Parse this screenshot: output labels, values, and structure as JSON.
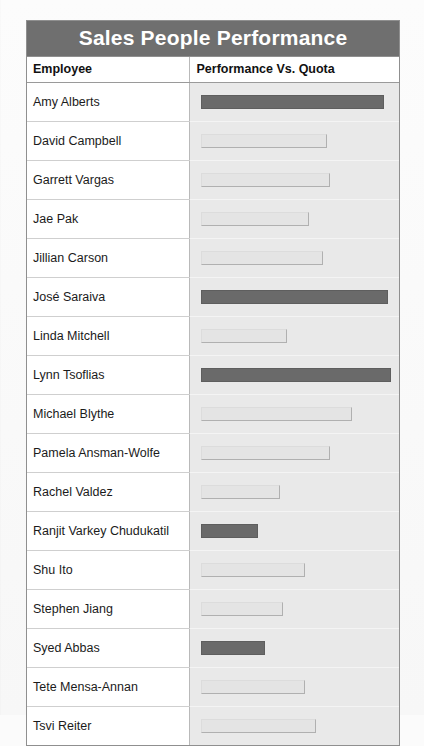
{
  "report": {
    "title": "Sales People Performance",
    "columns": [
      "Employee",
      "Performance Vs. Quota"
    ]
  },
  "colors": {
    "title_bar": "#6f6f6f",
    "title_text": "#ffffff",
    "bar_high": "#6a6a6a",
    "bar_low": "#e4e4e4",
    "bar_low_outline": "#b0b0b0",
    "plot_background": "#e9e9e9",
    "grid_border": "#8f8f8f"
  },
  "chart_data": {
    "type": "bar",
    "orientation": "horizontal",
    "title": "Sales People Performance",
    "xlabel": "Performance Vs. Quota",
    "ylabel": "Employee",
    "grid": false,
    "legend": "none",
    "value_unit": "relative bar length (0-100)",
    "xlim": [
      0,
      100
    ],
    "categories": [
      "Amy Alberts",
      "David Campbell",
      "Garrett Vargas",
      "Jae Pak",
      "Jillian Carson",
      "José Saraiva",
      "Linda Mitchell",
      "Lynn Tsoflias",
      "Michael Blythe",
      "Pamela Ansman-Wolfe",
      "Rachel Valdez",
      "Ranjit Varkey Chudukatil",
      "Shu Ito",
      "Stephen Jiang",
      "Syed Abbas",
      "Tete Mensa-Annan",
      "Tsvi Reiter"
    ],
    "values": [
      51,
      35,
      36,
      30,
      34,
      52,
      24,
      53,
      42,
      36,
      22,
      16,
      29,
      23,
      18,
      29,
      32
    ],
    "series": [
      {
        "name": "Performance Vs. Quota",
        "values": [
          51,
          35,
          36,
          30,
          34,
          52,
          24,
          53,
          42,
          36,
          22,
          16,
          29,
          23,
          18,
          29,
          32
        ]
      }
    ]
  },
  "rows": [
    {
      "employee": "Amy Alberts",
      "value": 51,
      "style": "dark"
    },
    {
      "employee": "David Campbell",
      "value": 35,
      "style": "light"
    },
    {
      "employee": "Garrett Vargas",
      "value": 36,
      "style": "light"
    },
    {
      "employee": "Jae Pak",
      "value": 30,
      "style": "light"
    },
    {
      "employee": "Jillian Carson",
      "value": 34,
      "style": "light"
    },
    {
      "employee": "José Saraiva",
      "value": 52,
      "style": "dark"
    },
    {
      "employee": "Linda Mitchell",
      "value": 24,
      "style": "light"
    },
    {
      "employee": "Lynn Tsoflias",
      "value": 53,
      "style": "dark"
    },
    {
      "employee": "Michael Blythe",
      "value": 42,
      "style": "light"
    },
    {
      "employee": "Pamela Ansman-Wolfe",
      "value": 36,
      "style": "light"
    },
    {
      "employee": "Rachel Valdez",
      "value": 22,
      "style": "light"
    },
    {
      "employee": "Ranjit Varkey Chudukatil",
      "value": 16,
      "style": "dark"
    },
    {
      "employee": "Shu Ito",
      "value": 29,
      "style": "light"
    },
    {
      "employee": "Stephen Jiang",
      "value": 23,
      "style": "light"
    },
    {
      "employee": "Syed Abbas",
      "value": 18,
      "style": "dark"
    },
    {
      "employee": "Tete Mensa-Annan",
      "value": 29,
      "style": "light"
    },
    {
      "employee": "Tsvi Reiter",
      "value": 32,
      "style": "light"
    }
  ]
}
